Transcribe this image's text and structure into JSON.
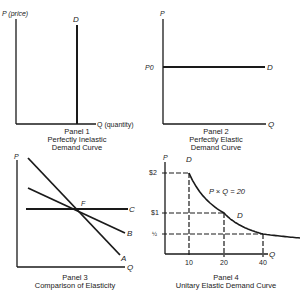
{
  "chart_data": [
    {
      "type": "line",
      "panel": "Panel 1",
      "title": "Perfectly Inelastic",
      "subtitle": "Demand Curve",
      "ylabel": "P (price)",
      "xlabel": "Q (quantity)",
      "series": [
        {
          "name": "D",
          "description": "vertical demand line, quantity fixed regardless of price"
        }
      ]
    },
    {
      "type": "line",
      "panel": "Panel 2",
      "title": "Perfectly Elastic",
      "subtitle": "Demand Curve",
      "ylabel": "P",
      "xlabel": "Q",
      "price_level_label": "P0",
      "series": [
        {
          "name": "D",
          "description": "horizontal demand line at P0"
        }
      ]
    },
    {
      "type": "line",
      "panel": "Panel 3",
      "title": "Comparison of Elasticity",
      "ylabel": "P",
      "xlabel": "Q",
      "intersection_label": "F",
      "series": [
        {
          "name": "A",
          "description": "steepest downward sloping demand line"
        },
        {
          "name": "B",
          "description": "flatter downward sloping demand line"
        },
        {
          "name": "C",
          "description": "horizontal demand line"
        }
      ]
    },
    {
      "type": "line",
      "panel": "Panel 4",
      "title": "Unitary Elastic Demand Curve",
      "ylabel": "P",
      "xlabel": "Q",
      "equation": "P × Q = 20",
      "curve_label": "D",
      "y_tick_labels": [
        "$2",
        "$1",
        "½"
      ],
      "y_ticks": [
        2,
        1,
        0.5
      ],
      "x_tick_labels": [
        "10",
        "20",
        "40"
      ],
      "x_ticks": [
        10,
        20,
        40
      ],
      "points": [
        {
          "q": 10,
          "p": 2
        },
        {
          "q": 20,
          "p": 1
        },
        {
          "q": 40,
          "p": 0.5
        }
      ],
      "xlim": [
        0,
        50
      ],
      "ylim": [
        0,
        2.4
      ]
    }
  ],
  "captions": {
    "p1": {
      "panel": "Panel 1",
      "l1": "Perfectly Inelastic",
      "l2": "Demand Curve"
    },
    "p2": {
      "panel": "Panel 2",
      "l1": "Perfectly Elastic",
      "l2": "Demand Curve"
    },
    "p3": {
      "panel": "Panel 3",
      "l1": "Comparison of Elasticity"
    },
    "p4": {
      "panel": "Panel 4",
      "l1": "Unitary Elastic Demand Curve"
    }
  },
  "labels": {
    "p1_y": "P (price)",
    "p1_x": "Q (quantity)",
    "p1_d": "D",
    "p2_y": "P",
    "p2_x": "Q",
    "p2_p0": "P0",
    "p2_d": "D",
    "p3_y": "P",
    "p3_x": "Q",
    "p3_f": "F",
    "p3_a": "A",
    "p3_b": "B",
    "p3_c": "C",
    "p4_y": "P",
    "p4_x": "Q",
    "p4_d_top": "D",
    "p4_d_mid": "D",
    "p4_eq": "P × Q = 20",
    "p4_y2": "$2",
    "p4_y1": "$1",
    "p4_yh": "½",
    "p4_x10": "10",
    "p4_x20": "20",
    "p4_x40": "40"
  }
}
